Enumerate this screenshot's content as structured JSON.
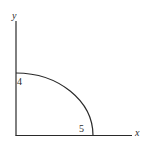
{
  "diagram": {
    "type": "quarter-ellipse",
    "axes": {
      "x_label": "x",
      "y_label": "y"
    },
    "intercepts": {
      "x_intercept_label": "5",
      "y_intercept_label": "4"
    },
    "curve": {
      "semi_axis_x": 5,
      "semi_axis_y": 4,
      "quadrant": "first"
    },
    "colors": {
      "stroke": "#2a2a2a",
      "background": "#ffffff"
    }
  }
}
